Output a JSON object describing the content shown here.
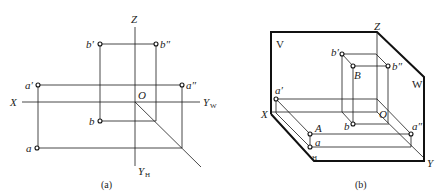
{
  "figure_a": {
    "caption": "(a)",
    "axes": {
      "z": "Z",
      "x": "X",
      "origin": "O",
      "yw_main": "Y",
      "yw_sub": "W",
      "yh_main": "Y",
      "yh_sub": "H"
    },
    "points": {
      "b_prime": "b′",
      "b_double_prime": "b″",
      "a_prime": "a′",
      "a_double_prime": "a″",
      "b": "b",
      "a": "a"
    }
  },
  "figure_b": {
    "caption": "(b)",
    "planes": {
      "v": "V",
      "w": "W",
      "h": "H"
    },
    "axes": {
      "z": "Z",
      "x": "X",
      "y": "Y",
      "origin": "O"
    },
    "points": {
      "b_prime": "b′",
      "B": "B",
      "b_double_prime": "b″",
      "b": "b",
      "a_prime": "a′",
      "A": "A",
      "a": "a",
      "a_double_prime": "a″"
    }
  },
  "colors": {
    "line": "#1a1a1a",
    "background": "#ffffff"
  }
}
